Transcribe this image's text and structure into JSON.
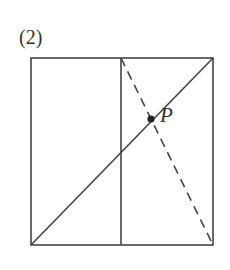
{
  "figure": {
    "label": "(2)",
    "stroke_color": "#444444",
    "point_color": "#222222",
    "square": {
      "x1": 31,
      "y1": 58,
      "x2": 213,
      "y2": 245
    },
    "vertical_line": {
      "x": 121,
      "y1": 58,
      "y2": 245
    },
    "diagonal": {
      "x1": 31,
      "y1": 245,
      "x2": 213,
      "y2": 58
    },
    "dashed_line": {
      "x1": 121,
      "y1": 58,
      "x2": 213,
      "y2": 245
    },
    "point": {
      "name": "P",
      "x": 151,
      "y": 119
    }
  }
}
